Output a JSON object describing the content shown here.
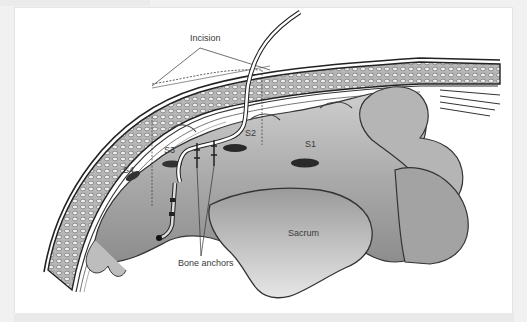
{
  "figure": {
    "labels": {
      "incision": "Incision",
      "s1": "S1",
      "s2": "S2",
      "s3": "S3",
      "s4": "S4",
      "sacrum": "Sacrum",
      "bone_anchors": "Bone anchors"
    },
    "colors": {
      "background": "#ffffff",
      "frame_border": "#e4e4e4",
      "page": "#f1f1f1",
      "bone_light": "#d9d9d9",
      "bone_mid": "#a8a8a8",
      "bone_dark": "#4a4a4a",
      "label_text": "#3a3a3a"
    }
  }
}
